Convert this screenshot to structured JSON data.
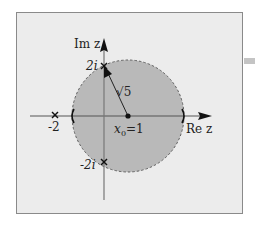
{
  "diagram": {
    "type": "complex-plane-disk",
    "axes": {
      "real_label": "Re z",
      "imag_label": "Im z"
    },
    "points": [
      {
        "name": "-2",
        "label": "-2",
        "re": -2,
        "im": 0,
        "marker": "x"
      },
      {
        "name": "2i",
        "label": "2i",
        "re": 0,
        "im": 2,
        "marker": "x"
      },
      {
        "name": "-2i",
        "label": "-2i",
        "re": 0,
        "im": -2,
        "marker": "x"
      },
      {
        "name": "center",
        "label": "x0=1",
        "re": 1,
        "im": 0,
        "marker": "dot"
      }
    ],
    "center_label_main": "x",
    "center_label_sub": "0",
    "center_label_eq": "=1",
    "radius_label": "√5",
    "radius_label_root": "√",
    "radius_label_val": "5",
    "label_minus2": "-2",
    "label_2i": "2i",
    "label_minus2i": "-2i",
    "disk": {
      "center": 1,
      "radius": "√5",
      "fill_color": "#b9b9b9",
      "boundary": "dashed"
    },
    "colors": {
      "background": "#ececec",
      "border": "#8a8a8a",
      "axis": "#555555"
    }
  }
}
